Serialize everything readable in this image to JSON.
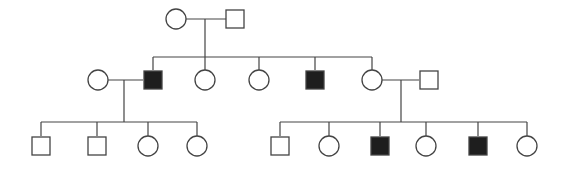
{
  "diagram": {
    "type": "pedigree",
    "width": 567,
    "height": 171,
    "colors": {
      "line": "#444444",
      "affected_fill": "#1e1e1e",
      "unaffected_fill": "#ffffff"
    },
    "symbol_size": 20,
    "generations": [
      {
        "label": "I",
        "members": [
          {
            "id": "I-1",
            "sex": "female",
            "affected": false,
            "x": 176,
            "y": 19
          },
          {
            "id": "I-2",
            "sex": "male",
            "affected": false,
            "x": 235,
            "y": 19
          }
        ]
      },
      {
        "label": "II",
        "members": [
          {
            "id": "II-1",
            "sex": "female",
            "affected": false,
            "x": 98,
            "y": 80,
            "spouse": true
          },
          {
            "id": "II-2",
            "sex": "male",
            "affected": true,
            "x": 153,
            "y": 80
          },
          {
            "id": "II-3",
            "sex": "female",
            "affected": false,
            "x": 205,
            "y": 80
          },
          {
            "id": "II-4",
            "sex": "female",
            "affected": false,
            "x": 259,
            "y": 80
          },
          {
            "id": "II-5",
            "sex": "male",
            "affected": true,
            "x": 315,
            "y": 80
          },
          {
            "id": "II-6",
            "sex": "female",
            "affected": false,
            "x": 372,
            "y": 80
          },
          {
            "id": "II-7",
            "sex": "male",
            "affected": false,
            "x": 429,
            "y": 80,
            "spouse": true
          }
        ]
      },
      {
        "label": "III",
        "members": [
          {
            "id": "III-1",
            "sex": "male",
            "affected": false,
            "x": 41,
            "y": 146
          },
          {
            "id": "III-2",
            "sex": "male",
            "affected": false,
            "x": 97,
            "y": 146
          },
          {
            "id": "III-3",
            "sex": "female",
            "affected": false,
            "x": 148,
            "y": 146
          },
          {
            "id": "III-4",
            "sex": "female",
            "affected": false,
            "x": 197,
            "y": 146
          },
          {
            "id": "III-5",
            "sex": "male",
            "affected": false,
            "x": 280,
            "y": 146
          },
          {
            "id": "III-6",
            "sex": "female",
            "affected": false,
            "x": 329,
            "y": 146
          },
          {
            "id": "III-7",
            "sex": "male",
            "affected": true,
            "x": 380,
            "y": 146
          },
          {
            "id": "III-8",
            "sex": "female",
            "affected": false,
            "x": 426,
            "y": 146
          },
          {
            "id": "III-9",
            "sex": "male",
            "affected": true,
            "x": 478,
            "y": 146
          },
          {
            "id": "III-10",
            "sex": "female",
            "affected": false,
            "x": 527,
            "y": 146
          }
        ]
      }
    ],
    "matings": [
      {
        "partners": [
          "I-1",
          "I-2"
        ],
        "line": [
          186,
          19,
          226,
          19
        ],
        "descent": [
          205,
          19,
          205,
          57
        ],
        "sibship": [
          153,
          57,
          372,
          57
        ],
        "children": [
          "II-2",
          "II-3",
          "II-4",
          "II-5",
          "II-6"
        ]
      },
      {
        "partners": [
          "II-1",
          "II-2"
        ],
        "line": [
          108,
          80,
          143,
          80
        ],
        "descent": [
          124,
          80,
          124,
          122
        ],
        "sibship": [
          41,
          122,
          197,
          122
        ],
        "children": [
          "III-1",
          "III-2",
          "III-3",
          "III-4"
        ]
      },
      {
        "partners": [
          "II-6",
          "II-7"
        ],
        "line": [
          382,
          80,
          419,
          80
        ],
        "descent": [
          401,
          80,
          401,
          122
        ],
        "sibship": [
          280,
          122,
          527,
          122
        ],
        "children": [
          "III-5",
          "III-6",
          "III-7",
          "III-8",
          "III-9",
          "III-10"
        ]
      }
    ]
  }
}
